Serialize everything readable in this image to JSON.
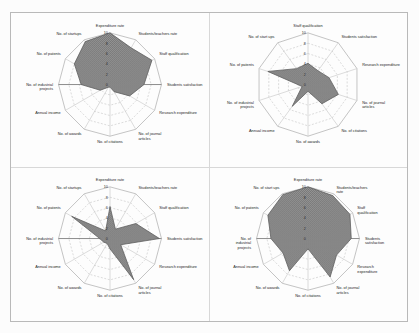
{
  "figure": {
    "background_color": "#fdfdfd",
    "border_color": "#b9b9b9",
    "fill_color": "#808080",
    "outline_color": "#5f5f5f",
    "grid_color": "#c9c9c9"
  },
  "chart_data": [
    {
      "type": "radar",
      "panel": "top-left",
      "title": "",
      "categories": [
        "Expenditure rate",
        "Students/teachers rate",
        "Staff qualification",
        "Students satisfaction",
        "Research expenditure",
        "No. of journal articles",
        "No. of citations",
        "No. of awards",
        "Annual income",
        "No. of industrial projects",
        "No. of patents",
        "No. of startups"
      ],
      "values": [
        10.0,
        8.2,
        9.4,
        6.6,
        4.4,
        1.6,
        0.5,
        0.6,
        2.2,
        5.6,
        8.0,
        9.6
      ],
      "tick_labels": [
        "10",
        "8",
        "6",
        "4",
        "2",
        "0"
      ],
      "rlim": [
        0,
        10
      ],
      "rticks": [
        0,
        2,
        4,
        6,
        8,
        10
      ],
      "grid": true,
      "legend": "none"
    },
    {
      "type": "radar",
      "panel": "top-right",
      "title": "",
      "categories": [
        "Staff qualification",
        "Students satisfaction",
        "Research expenditure",
        "No. of journal articles",
        "No. of citations",
        "No. of awards",
        "Annual income",
        "No. of industrial projects",
        "No. of patents",
        "No. of start ups"
      ],
      "values": [
        4.1,
        3.3,
        4.3,
        6.2,
        4.6,
        1.3,
        5.2,
        1.2,
        8.2,
        3.8
      ],
      "tick_labels": [
        "10",
        "8",
        "6",
        "4",
        "2",
        "0"
      ],
      "rlim": [
        0,
        10
      ],
      "rticks": [
        0,
        2,
        4,
        6,
        8,
        10
      ],
      "grid": true,
      "legend": "none"
    },
    {
      "type": "radar",
      "panel": "bottom-left",
      "title": "",
      "categories": [
        "Expenditure rate",
        "Students/teachers rate",
        "Staff qualification",
        "Students satisfaction",
        "Research expenditure",
        "No. of journal articles",
        "No. of citations",
        "No. of awards",
        "Annual income",
        "No. of industrial projects",
        "No. of patents",
        "No. of startups"
      ],
      "values": [
        6.2,
        2.1,
        5.8,
        9.6,
        2.4,
        9.2,
        2.0,
        1.1,
        1.4,
        2.0,
        8.6,
        1.7
      ],
      "tick_labels": [
        "10",
        "8",
        "6",
        "4",
        "2",
        "0"
      ],
      "rlim": [
        0,
        10
      ],
      "rticks": [
        0,
        2,
        4,
        6,
        8,
        10
      ],
      "grid": true,
      "legend": "none"
    },
    {
      "type": "radar",
      "panel": "bottom-right",
      "title": "",
      "categories": [
        "Expenditure rate",
        "Students/teachers rate",
        "Staff qualification",
        "Students satisfaction",
        "Research expenditure",
        "No. of journal articles",
        "No. of citations",
        "No. of awards",
        "Annual income",
        "No. of industrial projects",
        "No. of patents",
        "No. of start ups"
      ],
      "values": [
        10.0,
        9.6,
        9.4,
        8.4,
        6.4,
        8.6,
        2.0,
        7.2,
        5.6,
        7.2,
        9.0,
        9.8
      ],
      "tick_labels": [
        "10",
        "8",
        "6",
        "4",
        "2",
        "0"
      ],
      "rlim": [
        0,
        10
      ],
      "rticks": [
        0,
        2,
        4,
        6,
        8,
        10
      ],
      "grid": true,
      "legend": "none"
    }
  ]
}
